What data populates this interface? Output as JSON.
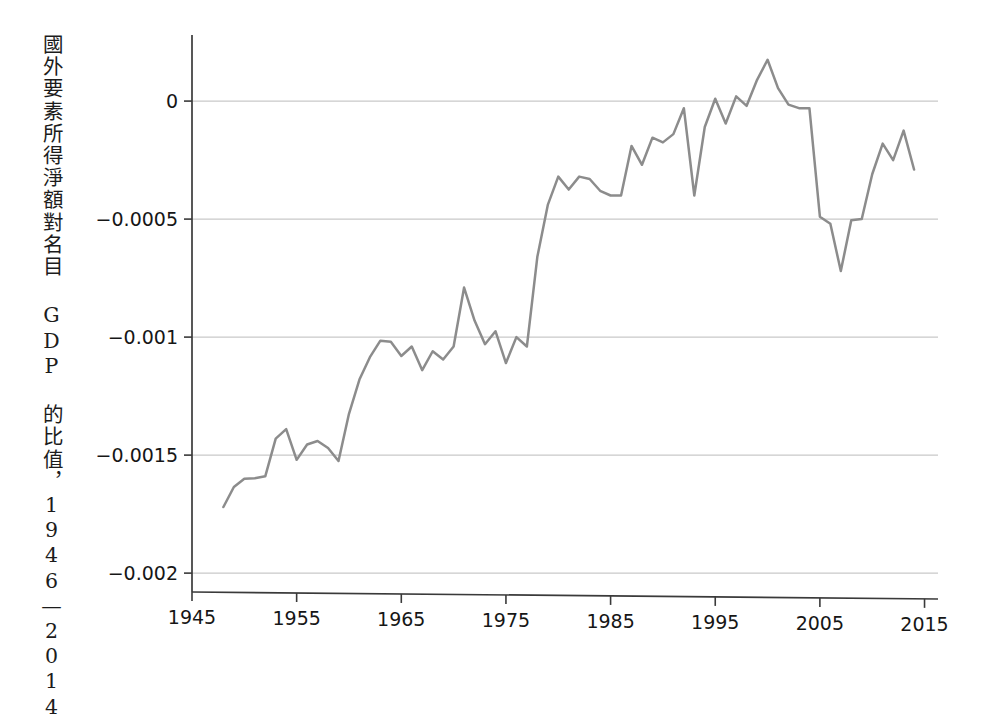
{
  "chart_data": {
    "type": "line",
    "title": "",
    "subtitle": "",
    "xlabel": "",
    "ylabel": "國外要素所得淨額對名目 GDP 的比值，1946—2014",
    "xlim": [
      1945,
      2016
    ],
    "ylim": [
      -0.00208,
      0.00028
    ],
    "xticks": [
      1945,
      1955,
      1965,
      1975,
      1985,
      1995,
      2005,
      2015
    ],
    "xticklabels": [
      "1945",
      "1955",
      "1965",
      "1975",
      "1985",
      "1995",
      "2005",
      "2015"
    ],
    "yticks": [
      0,
      -0.0005,
      -0.001,
      -0.0015,
      -0.002
    ],
    "yticklabels": [
      "0",
      "−0.0005",
      "−0.001",
      "−0.0015",
      "−0.002"
    ],
    "grid": "horizontal",
    "legend": "none",
    "line_color": "#8c8c8c",
    "gridline_color": "#c9c9c9",
    "axis_color": "#3a3a3a",
    "background_color": "#ffffff",
    "series": [
      {
        "name": "國外要素所得淨額對名目 GDP 的比值",
        "x": [
          1948,
          1949,
          1950,
          1951,
          1952,
          1953,
          1954,
          1955,
          1956,
          1957,
          1958,
          1959,
          1960,
          1961,
          1962,
          1963,
          1964,
          1965,
          1966,
          1967,
          1968,
          1969,
          1970,
          1971,
          1972,
          1973,
          1974,
          1975,
          1976,
          1977,
          1978,
          1979,
          1980,
          1981,
          1982,
          1983,
          1984,
          1985,
          1986,
          1987,
          1988,
          1989,
          1990,
          1991,
          1992,
          1993,
          1994,
          1995,
          1996,
          1997,
          1998,
          1999,
          2000,
          2001,
          2002,
          2003,
          2004,
          2005,
          2006,
          2007,
          2008,
          2009,
          2010,
          2011,
          2012,
          2013,
          2014
        ],
        "values": [
          -0.00172,
          -0.001635,
          -0.0016,
          -0.001598,
          -0.00159,
          -0.00143,
          -0.00139,
          -0.00152,
          -0.001455,
          -0.00144,
          -0.00147,
          -0.001525,
          -0.001325,
          -0.00118,
          -0.001085,
          -0.001015,
          -0.00102,
          -0.00108,
          -0.00104,
          -0.00114,
          -0.00106,
          -0.001095,
          -0.00104,
          -0.00079,
          -0.00093,
          -0.00103,
          -0.000975,
          -0.00111,
          -0.001,
          -0.00104,
          -0.00066,
          -0.00044,
          -0.00032,
          -0.000375,
          -0.00032,
          -0.00033,
          -0.00038,
          -0.0004,
          -0.0004,
          -0.00019,
          -0.00027,
          -0.000155,
          -0.000175,
          -0.00014,
          -3e-05,
          -0.0004,
          -0.00011,
          1e-05,
          -9.5e-05,
          2e-05,
          -2e-05,
          9e-05,
          0.000175,
          5.5e-05,
          -1.5e-05,
          -3e-05,
          -3e-05,
          -0.00049,
          -0.00052,
          -0.00072,
          -0.000505,
          -0.0005,
          -0.00031,
          -0.00018,
          -0.00025,
          -0.000125,
          -0.00029
        ]
      }
    ]
  },
  "axis": {
    "y_tick_labels": [
      "0",
      "−0.0005",
      "−0.001",
      "−0.0015",
      "−0.002"
    ],
    "x_tick_labels": [
      "1945",
      "1955",
      "1965",
      "1975",
      "1985",
      "1995",
      "2005",
      "2015"
    ]
  },
  "ylabel_text": "國外要素所得淨額對名目 GDP 的比值，1946—2014"
}
